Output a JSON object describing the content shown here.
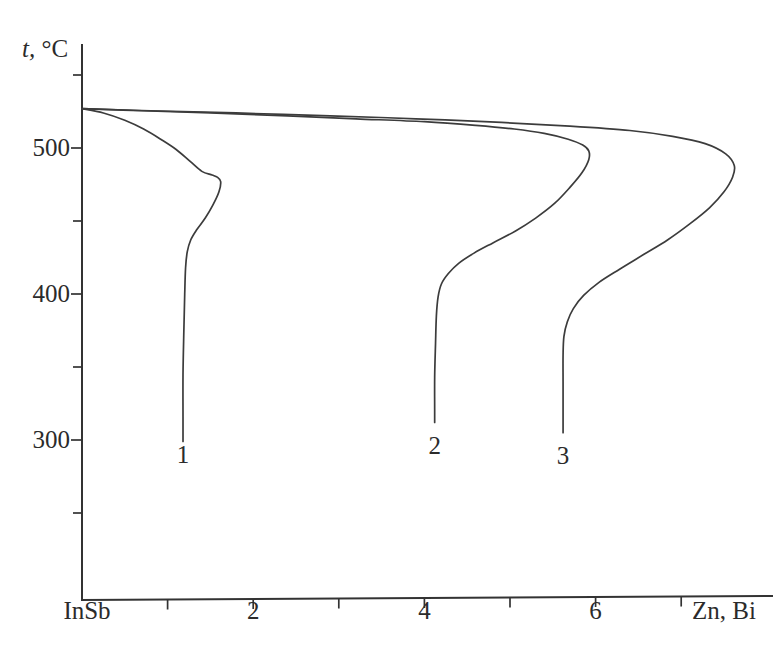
{
  "chart_data": {
    "type": "line",
    "title": "",
    "subtitle": "",
    "xlabel": "Zn, Bi",
    "ylabel": "t, °C",
    "ylabel_symbol": "t,",
    "ylabel_unit": "°C",
    "x_origin_label": "InSb",
    "xlim": [
      0,
      8.1
    ],
    "ylim": [
      215,
      557
    ],
    "grid": false,
    "legend_position": "inline-curve-labels",
    "x_ticks": [
      {
        "value": 1,
        "label": ""
      },
      {
        "value": 2,
        "label": "2"
      },
      {
        "value": 3,
        "label": ""
      },
      {
        "value": 4,
        "label": "4"
      },
      {
        "value": 5,
        "label": ""
      },
      {
        "value": 6,
        "label": "6"
      },
      {
        "value": 7,
        "label": ""
      }
    ],
    "y_ticks": [
      {
        "value": 550,
        "label": ""
      },
      {
        "value": 500,
        "label": "500"
      },
      {
        "value": 450,
        "label": ""
      },
      {
        "value": 400,
        "label": "400"
      },
      {
        "value": 350,
        "label": ""
      },
      {
        "value": 300,
        "label": "300"
      },
      {
        "value": 250,
        "label": ""
      }
    ],
    "common_start": {
      "x": 0,
      "y": 527
    },
    "series": [
      {
        "name": "1",
        "label": "1",
        "label_point": {
          "x": 1.18,
          "y": 290
        },
        "nose": {
          "x": 1.58,
          "y": 480
        },
        "points": [
          [
            0.0,
            527.0
          ],
          [
            0.25,
            524.0
          ],
          [
            0.5,
            519.0
          ],
          [
            0.72,
            513.0
          ],
          [
            0.92,
            506.0
          ],
          [
            1.1,
            499.0
          ],
          [
            1.26,
            491.0
          ],
          [
            1.4,
            484.0
          ],
          [
            1.52,
            481.5
          ],
          [
            1.58,
            480.0
          ],
          [
            1.62,
            477.0
          ],
          [
            1.6,
            470.0
          ],
          [
            1.53,
            461.0
          ],
          [
            1.44,
            452.0
          ],
          [
            1.34,
            444.0
          ],
          [
            1.27,
            437.0
          ],
          [
            1.23,
            429.0
          ],
          [
            1.21,
            418.0
          ],
          [
            1.2,
            400.0
          ],
          [
            1.19,
            375.0
          ],
          [
            1.18,
            345.0
          ],
          [
            1.18,
            316.0
          ],
          [
            1.18,
            299.0
          ]
        ]
      },
      {
        "name": "2",
        "label": "2",
        "label_point": {
          "x": 4.12,
          "y": 296
        },
        "nose": {
          "x": 5.92,
          "y": 499
        },
        "points": [
          [
            0.0,
            527.0
          ],
          [
            0.7,
            525.5
          ],
          [
            1.5,
            524.0
          ],
          [
            2.4,
            522.0
          ],
          [
            3.2,
            520.0
          ],
          [
            4.0,
            518.0
          ],
          [
            4.6,
            515.5
          ],
          [
            5.05,
            513.0
          ],
          [
            5.4,
            510.0
          ],
          [
            5.68,
            506.0
          ],
          [
            5.85,
            502.0
          ],
          [
            5.92,
            498.0
          ],
          [
            5.92,
            492.0
          ],
          [
            5.84,
            483.0
          ],
          [
            5.7,
            473.0
          ],
          [
            5.52,
            462.0
          ],
          [
            5.3,
            452.0
          ],
          [
            5.06,
            443.0
          ],
          [
            4.8,
            435.0
          ],
          [
            4.58,
            428.0
          ],
          [
            4.4,
            421.0
          ],
          [
            4.28,
            414.0
          ],
          [
            4.2,
            407.0
          ],
          [
            4.16,
            398.0
          ],
          [
            4.14,
            385.0
          ],
          [
            4.13,
            366.0
          ],
          [
            4.12,
            343.0
          ],
          [
            4.12,
            321.0
          ],
          [
            4.12,
            312.0
          ]
        ]
      },
      {
        "name": "3",
        "label": "3",
        "label_point": {
          "x": 5.62,
          "y": 289
        },
        "nose": {
          "x": 7.62,
          "y": 484
        },
        "points": [
          [
            0.0,
            527.0
          ],
          [
            0.8,
            525.5
          ],
          [
            1.8,
            524.0
          ],
          [
            2.9,
            522.0
          ],
          [
            3.9,
            520.0
          ],
          [
            4.9,
            517.5
          ],
          [
            5.7,
            515.0
          ],
          [
            6.4,
            512.0
          ],
          [
            6.9,
            508.0
          ],
          [
            7.28,
            503.0
          ],
          [
            7.52,
            496.0
          ],
          [
            7.62,
            488.0
          ],
          [
            7.6,
            480.0
          ],
          [
            7.5,
            470.0
          ],
          [
            7.33,
            459.0
          ],
          [
            7.1,
            448.0
          ],
          [
            6.84,
            437.0
          ],
          [
            6.56,
            427.0
          ],
          [
            6.28,
            417.0
          ],
          [
            6.04,
            408.0
          ],
          [
            5.86,
            399.0
          ],
          [
            5.74,
            390.0
          ],
          [
            5.67,
            381.0
          ],
          [
            5.63,
            371.0
          ],
          [
            5.62,
            358.0
          ],
          [
            5.62,
            340.0
          ],
          [
            5.62,
            320.0
          ],
          [
            5.62,
            305.0
          ]
        ]
      }
    ]
  },
  "axes": {
    "y_axis_name": "temperature-axis",
    "x_axis_name": "composition-axis"
  }
}
